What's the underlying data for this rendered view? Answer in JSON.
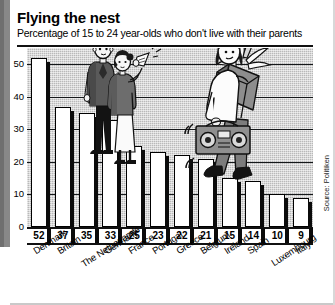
{
  "header": {
    "title": "Flying the nest",
    "subtitle": "Percentage of 15 to 24 year-olds who don't live with their parents"
  },
  "source": {
    "credit": "Source: Politiken"
  },
  "chart_data": {
    "type": "bar",
    "title": "Flying the nest",
    "subtitle": "Percentage of 15 to 24 year-olds who don't live with their parents",
    "xlabel": "",
    "ylabel": "",
    "ylim": [
      0,
      55
    ],
    "yticks": [
      0,
      10,
      20,
      30,
      40,
      50
    ],
    "grid": true,
    "legend": "none",
    "categories": [
      "Denmark",
      "Britain",
      "The Netherlands",
      "Germany",
      "France",
      "Portugal",
      "Greece",
      "Belgium",
      "Ireland",
      "Spain",
      "Luxembourg",
      "Italy"
    ],
    "values": [
      52,
      37,
      35,
      33,
      25,
      23,
      22,
      21,
      15,
      14,
      10,
      9
    ],
    "value_labels": [
      "52",
      "37",
      "35",
      "33",
      "25",
      "23",
      "22",
      "21",
      "15",
      "14",
      "10",
      "9"
    ],
    "annotations": [
      "Illustration: two parents waving farewell from tall bars",
      "Illustration: young adult walking down the bars carrying a box with a plant and a boombox"
    ]
  },
  "colors": {
    "plot_background": "#b9b9b9",
    "bar_fill": "#ffffff",
    "bar_outline": "#000000",
    "bar_shadow": "#0b0b0b",
    "text": "#000000",
    "spine_band": "#888888"
  }
}
